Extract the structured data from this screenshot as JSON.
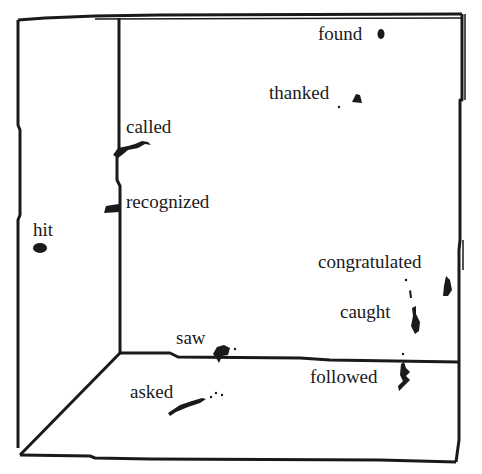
{
  "figure": {
    "type": "3d-box-semantic-space",
    "ink_color": "#1a1a1a",
    "background": "#ffffff"
  },
  "labels": [
    {
      "id": "found",
      "text": "found",
      "x": 318,
      "y": 24
    },
    {
      "id": "thanked",
      "text": "thanked",
      "x": 269,
      "y": 83
    },
    {
      "id": "called",
      "text": "called",
      "x": 126,
      "y": 117
    },
    {
      "id": "recognized",
      "text": "recognized",
      "x": 126,
      "y": 192
    },
    {
      "id": "hit",
      "text": "hit",
      "x": 33,
      "y": 220
    },
    {
      "id": "congratulated",
      "text": "congratulated",
      "x": 318,
      "y": 252
    },
    {
      "id": "caught",
      "text": "caught",
      "x": 340,
      "y": 302
    },
    {
      "id": "saw",
      "text": "saw",
      "x": 176,
      "y": 328
    },
    {
      "id": "followed",
      "text": "followed",
      "x": 310,
      "y": 367
    },
    {
      "id": "asked",
      "text": "asked",
      "x": 130,
      "y": 382
    }
  ]
}
